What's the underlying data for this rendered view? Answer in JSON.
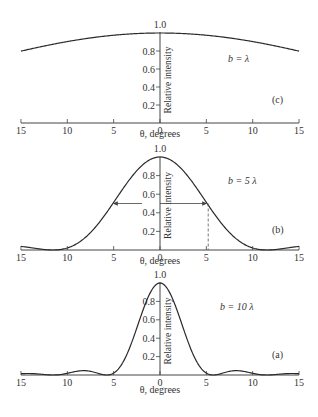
{
  "chart_data": [
    {
      "type": "line",
      "panel": "(c)",
      "annotation": "b = λ",
      "b_over_lambda": 1,
      "xlabel": "θ, degrees",
      "ylabel": "Relative intensity",
      "x_ticks": [
        15,
        10,
        5,
        0,
        5,
        10,
        15
      ],
      "y_ticks": [
        "0.2",
        "0.4",
        "0.6",
        "0.8",
        "1.0"
      ],
      "xlim": [
        -15,
        15
      ],
      "ylim": [
        0,
        1.0
      ],
      "x": [
        -15,
        -10,
        -5,
        0,
        5,
        10,
        15
      ],
      "values": [
        0.8,
        0.9,
        0.97,
        1.0,
        0.97,
        0.9,
        0.8
      ]
    },
    {
      "type": "line",
      "panel": "(b)",
      "annotation": "b = 5λ",
      "b_over_lambda": 5,
      "xlabel": "θ, degrees",
      "ylabel": "Relative intensity",
      "x_ticks": [
        15,
        10,
        5,
        0,
        5,
        10,
        15
      ],
      "y_ticks": [
        "0.2",
        "0.4",
        "0.6",
        "0.8",
        "1.0"
      ],
      "xlim": [
        -15,
        15
      ],
      "ylim": [
        0,
        1.0
      ],
      "x": [
        -15,
        -11.5,
        -10,
        -5,
        0,
        5,
        10,
        11.5,
        15
      ],
      "values": [
        0.05,
        0.0,
        0.03,
        0.5,
        1.0,
        0.5,
        0.03,
        0.0,
        0.05
      ],
      "half_width_marker": {
        "y": 0.5,
        "x": 5.2,
        "note": "arrows at half maximum, dashed drop line at ~5.2°"
      }
    },
    {
      "type": "line",
      "panel": "(a)",
      "annotation": "b = 10λ",
      "b_over_lambda": 10,
      "xlabel": "θ, degrees",
      "ylabel": "Relative intensity",
      "x_ticks": [
        15,
        10,
        5,
        0,
        5,
        10,
        15
      ],
      "y_ticks": [
        "0.2",
        "0.4",
        "0.6",
        "0.8",
        "1.0"
      ],
      "xlim": [
        -15,
        15
      ],
      "ylim": [
        0,
        1.0
      ],
      "x": [
        -15,
        -10,
        -5.7,
        -2.5,
        0,
        2.5,
        5.7,
        10,
        15
      ],
      "values": [
        0.02,
        0.05,
        0.0,
        0.45,
        1.0,
        0.45,
        0.0,
        0.05,
        0.02
      ]
    }
  ],
  "labels": {
    "xlabel": "θ, degrees",
    "ylabel": "Relative intensity",
    "x_ticks": [
      "15",
      "10",
      "5",
      "0",
      "5",
      "10",
      "15"
    ],
    "y_ticks": [
      "0.2",
      "0.4",
      "0.6",
      "0.8",
      "1.0"
    ],
    "panels": [
      {
        "tag": "(c)",
        "param": "b = λ"
      },
      {
        "tag": "(b)",
        "param": "b = 5 λ"
      },
      {
        "tag": "(a)",
        "param": "b = 10 λ"
      }
    ]
  }
}
